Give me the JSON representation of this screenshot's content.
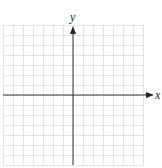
{
  "diagram": {
    "type": "coordinate-plane",
    "x_axis_label": "x",
    "y_axis_label": "y",
    "grid": {
      "columns": 14,
      "rows": 14,
      "cell_size_px": 10,
      "left_px": 3,
      "top_px": 25,
      "right_px": 143,
      "bottom_px": 165
    },
    "origin_px": {
      "x": 73,
      "y": 95
    },
    "colors": {
      "grid_line": "#e2e2e2",
      "axis_line": "#333333",
      "background": "#ffffff"
    }
  }
}
